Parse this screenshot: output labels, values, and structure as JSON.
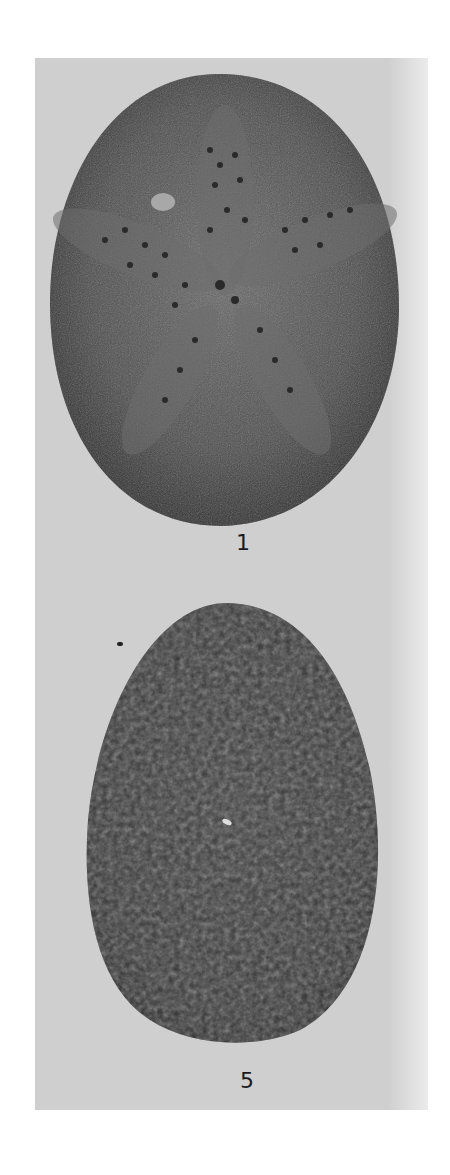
{
  "plate": {
    "background_color": "#cfcfcf",
    "specimens": [
      {
        "label": "1",
        "description": "Echinoid test, aboral view with petaloid ambulacra",
        "fill": "#4a4a4a"
      },
      {
        "label": "5",
        "description": "Echinoid test, tuberculate surface",
        "fill": "#3a3a3a"
      }
    ]
  }
}
